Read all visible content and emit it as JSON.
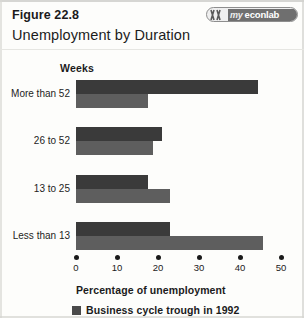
{
  "header": {
    "figure_number": "Figure 22.8",
    "title": "Unemployment by Duration",
    "logo": {
      "mark_icon": "myeconlab-mark-icon",
      "text_my": "my",
      "text_rest": "econlab"
    }
  },
  "chart_data": {
    "type": "bar",
    "orientation": "horizontal",
    "title": "Unemployment by Duration",
    "categories": [
      "More than 52",
      "26 to 52",
      "13 to 25",
      "Less than 13"
    ],
    "series": [
      {
        "name": "Business cycle trough in 1992",
        "color": "#3a3a3a",
        "values": [
          44.4,
          21.0,
          17.6,
          23.0
        ]
      },
      {
        "name": "",
        "color": "#5e5e5e",
        "values": [
          17.6,
          18.8,
          23.0,
          45.6
        ]
      }
    ],
    "xlabel": "Percentage of unemployment",
    "ylabel": "Weeks",
    "xlim": [
      0,
      50
    ],
    "xticks": [
      0,
      10,
      20,
      30,
      40,
      50
    ],
    "xtick_labels": [
      "0",
      "10",
      "20",
      "30",
      "40",
      "50"
    ],
    "grid": false,
    "legend_position": "bottom-left",
    "legend": [
      "Business cycle trough in 1992"
    ]
  },
  "axes": {
    "category_axis_title": "Weeks",
    "value_axis_title": "Percentage of unemployment"
  },
  "legend": {
    "swatch_color": "#4a4a4a",
    "label": "Business cycle trough in 1992"
  }
}
